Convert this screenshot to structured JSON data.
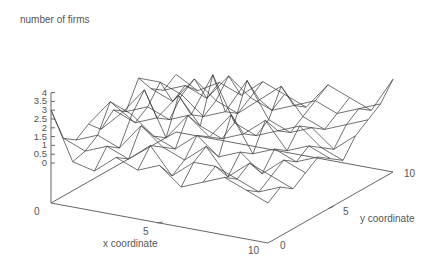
{
  "chart_data": {
    "type": "surface-wireframe",
    "title": "",
    "zlabel": "number of firms",
    "xlabel": "x coordinate",
    "ylabel": "y coordinate",
    "xlim": [
      0,
      10
    ],
    "ylim": [
      0,
      10
    ],
    "zlim": [
      0,
      4
    ],
    "x_ticks": [
      "0",
      "5",
      "10"
    ],
    "y_ticks": [
      "0",
      "5",
      "10"
    ],
    "z_ticks": [
      "0",
      "0.5",
      "1",
      "1.5",
      "2",
      "2.5",
      "3",
      "3.5",
      "4"
    ],
    "grid": false,
    "legend": null,
    "grid_size": [
      11,
      11
    ],
    "note": "z values approximate, read from wireframe; rows indexed by x (0..10), columns by y (0..10)",
    "z": [
      [
        3.0,
        1.0,
        0.5,
        1.0,
        0.3,
        1.0,
        0.5,
        2.0,
        1.0,
        0.5,
        1.0
      ],
      [
        0.3,
        0.5,
        1.0,
        2.5,
        1.5,
        0.5,
        1.0,
        2.0,
        0.5,
        1.0,
        0.3
      ],
      [
        0.0,
        1.0,
        0.5,
        2.0,
        3.0,
        1.0,
        0.5,
        1.5,
        2.0,
        0.5,
        1.0
      ],
      [
        1.0,
        0.5,
        2.0,
        1.0,
        0.5,
        2.5,
        1.0,
        0.5,
        1.0,
        2.0,
        0.5
      ],
      [
        0.5,
        1.5,
        1.0,
        0.5,
        2.0,
        1.0,
        3.5,
        1.0,
        0.5,
        1.0,
        1.5
      ],
      [
        1.0,
        0.0,
        0.5,
        1.5,
        1.0,
        0.5,
        1.0,
        3.0,
        1.5,
        0.5,
        1.0
      ],
      [
        0.0,
        1.0,
        1.5,
        0.5,
        2.5,
        1.0,
        0.5,
        1.0,
        2.5,
        1.0,
        0.5
      ],
      [
        0.5,
        1.0,
        0.0,
        1.0,
        0.5,
        2.0,
        1.0,
        0.5,
        1.0,
        1.5,
        2.0
      ],
      [
        1.0,
        0.5,
        1.0,
        0.0,
        1.0,
        0.5,
        1.5,
        1.0,
        0.5,
        1.0,
        1.5
      ],
      [
        0.5,
        0.0,
        0.5,
        1.0,
        0.5,
        1.0,
        0.5,
        0.0,
        1.0,
        1.5,
        1.0
      ],
      [
        0.0,
        0.5,
        0.0,
        0.5,
        1.0,
        0.5,
        0.0,
        1.0,
        1.5,
        2.0,
        3.0
      ]
    ]
  },
  "projection": {
    "origin": [
      51,
      203
    ],
    "x_end": [
      268,
      243
    ],
    "y_end": [
      176,
      132
    ],
    "z_unit_px": 17.6,
    "z_zero_offset": 40
  },
  "labels": {
    "zlabel": "number of firms",
    "xlabel": "x coordinate",
    "ylabel": "y coordinate"
  },
  "colors": {
    "axis": "#555555",
    "mesh": "#333333",
    "text": "#555555"
  }
}
